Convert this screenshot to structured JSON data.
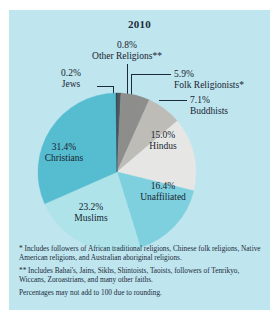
{
  "figure": {
    "title": "2010",
    "background": "#bfe5ee",
    "text_color": "#16242f"
  },
  "footnotes": {
    "single_asterisk": "* Includes followers of African traditional religions, Chinese folk religions, Native American religions, and Australian aboriginal religions.",
    "double_asterisk": "** Includes Bahai's, Jains, Sikhs, Shintoists, Taoists, followers of Tenrikyo, Wiccans, Zoroastrians, and many other faiths.",
    "rounding_note": "Percentages may not add to 100 due to rounding."
  },
  "labels": {
    "other_religions": {
      "pct": "0.8%",
      "name": "Other Religions**"
    },
    "jews": {
      "pct": "0.2%",
      "name": "Jews"
    },
    "folk": {
      "pct": "5.9%",
      "name": "Folk Religionists*"
    },
    "buddhists": {
      "pct": "7.1%",
      "name": "Buddhists"
    },
    "hindus": {
      "pct": "15.0%",
      "name": "Hindus"
    },
    "unaffiliated": {
      "pct": "16.4%",
      "name": "Unaffiliated"
    },
    "muslims": {
      "pct": "23.2%",
      "name": "Muslims"
    },
    "christians": {
      "pct": "31.4%",
      "name": "Christians"
    }
  },
  "chart_data": {
    "type": "pie",
    "title": "2010",
    "xlabel": "",
    "ylabel": "",
    "legend_position": "none",
    "grid": false,
    "start_angle_deg": 0,
    "direction": "clockwise",
    "categories": [
      "Other Religions**",
      "Folk Religionists*",
      "Buddhists",
      "Hindus",
      "Unaffiliated",
      "Muslims",
      "Christians",
      "Jews"
    ],
    "values": [
      0.8,
      5.9,
      7.1,
      15.0,
      16.4,
      23.2,
      31.4,
      0.2
    ],
    "value_labels": [
      "0.8%",
      "5.9%",
      "7.1%",
      "15.0%",
      "16.4%",
      "23.2%",
      "31.4%",
      "0.2%"
    ],
    "colors": [
      "#4f5a60",
      "#8d8d8b",
      "#bdbcb7",
      "#e6e7e4",
      "#7fd0de",
      "#aee3ea",
      "#56bcd0",
      "#2f4450"
    ],
    "annotations": [
      "* Includes followers of African traditional religions, Chinese folk religions, Native American religions, and Australian aboriginal religions.",
      "** Includes Bahai's, Jains, Sikhs, Shintoists, Taoists, followers of Tenrikyo, Wiccans, Zoroastrians, and many other faiths.",
      "Percentages may not add to 100 due to rounding."
    ]
  }
}
